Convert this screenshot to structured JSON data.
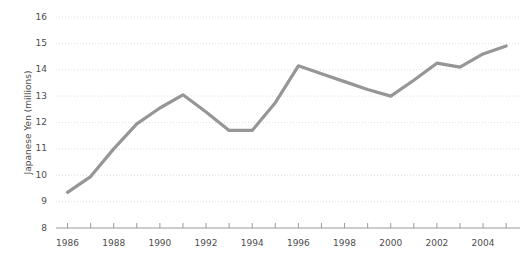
{
  "chart_data": {
    "type": "line",
    "title": "",
    "subtitle": "",
    "xlabel": "",
    "ylabel": "Japanese Yen (millions)",
    "x": [
      1986,
      1987,
      1988,
      1989,
      1990,
      1991,
      1992,
      1993,
      1994,
      1995,
      1996,
      1997,
      1998,
      1999,
      2000,
      2001,
      2002,
      2003,
      2004,
      2005
    ],
    "values": [
      9.35,
      9.95,
      11.0,
      11.95,
      12.55,
      13.05,
      12.4,
      11.7,
      11.7,
      12.75,
      14.15,
      13.85,
      13.55,
      13.25,
      13.0,
      13.6,
      14.25,
      14.1,
      14.6,
      14.9
    ],
    "series": [
      {
        "name": "Japanese Yen (millions)",
        "values": [
          9.35,
          9.95,
          11.0,
          11.95,
          12.55,
          13.05,
          12.4,
          11.7,
          11.7,
          12.75,
          14.15,
          13.85,
          13.55,
          13.25,
          13.0,
          13.6,
          14.25,
          14.1,
          14.6,
          14.9
        ],
        "color": "#969696"
      }
    ],
    "xlim": [
      1985.5,
      2005.6
    ],
    "ylim": [
      8,
      16
    ],
    "ytick_labels": [
      "8",
      "9",
      "10",
      "11",
      "12",
      "13",
      "14",
      "15",
      "16"
    ],
    "ytick_values": [
      8,
      9,
      10,
      11,
      12,
      13,
      14,
      15,
      16
    ],
    "xtick_values": [
      1986,
      1987,
      1988,
      1989,
      1990,
      1991,
      1992,
      1993,
      1994,
      1995,
      1996,
      1997,
      1998,
      1999,
      2000,
      2001,
      2002,
      2003,
      2004,
      2005
    ],
    "xtick_labels_shown": [
      "1986",
      "1988",
      "1990",
      "1992",
      "1994",
      "1996",
      "1998",
      "2000",
      "2002",
      "2004"
    ],
    "xtick_labels_values": [
      1986,
      1988,
      1990,
      1992,
      1994,
      1996,
      1998,
      2000,
      2002,
      2004
    ],
    "grid": true,
    "grid_axis": "y",
    "legend": false,
    "legend_position": "none",
    "line_color": "#969696",
    "grid_color": "#d9d9d9",
    "axis_color": "#9a9a9a",
    "text_color": "#4d4d4d",
    "background_color": "#ffffff",
    "annotations": []
  }
}
